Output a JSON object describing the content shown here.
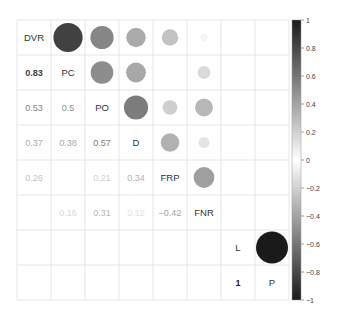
{
  "chart_data": {
    "type": "heatmap",
    "subtype": "correlation-matrix (mixed: numbers lower, circles upper)",
    "title": "",
    "variables": [
      "DVR",
      "PC",
      "PO",
      "D",
      "FRP",
      "FNR",
      "L",
      "P"
    ],
    "matrix": [
      [
        1.0,
        0.83,
        0.53,
        0.37,
        0.26,
        0.05,
        0.0,
        0.0
      ],
      [
        0.83,
        1.0,
        0.5,
        0.38,
        0.02,
        0.16,
        0.0,
        0.0
      ],
      [
        0.53,
        0.5,
        1.0,
        0.57,
        0.21,
        0.31,
        0.0,
        0.0
      ],
      [
        0.37,
        0.38,
        0.57,
        1.0,
        0.34,
        0.12,
        0.02,
        0.0
      ],
      [
        0.26,
        0.02,
        0.21,
        0.34,
        1.0,
        -0.42,
        0.0,
        0.0
      ],
      [
        0.05,
        0.16,
        0.31,
        0.12,
        -0.42,
        1.0,
        0.0,
        0.0
      ],
      [
        0.0,
        0.0,
        0.0,
        0.02,
        0.0,
        0.0,
        1.0,
        1.0
      ],
      [
        0.0,
        0.0,
        0.0,
        0.0,
        0.0,
        0.0,
        1.0,
        1.0
      ]
    ],
    "lower_labels": [
      {
        "row": 1,
        "col": 0,
        "text": "0.83"
      },
      {
        "row": 2,
        "col": 0,
        "text": "0.53"
      },
      {
        "row": 2,
        "col": 1,
        "text": "0.5"
      },
      {
        "row": 3,
        "col": 0,
        "text": "0.37"
      },
      {
        "row": 3,
        "col": 1,
        "text": "0.38"
      },
      {
        "row": 3,
        "col": 2,
        "text": "0.57"
      },
      {
        "row": 4,
        "col": 0,
        "text": "0.26"
      },
      {
        "row": 4,
        "col": 2,
        "text": "0.21"
      },
      {
        "row": 4,
        "col": 3,
        "text": "0.34"
      },
      {
        "row": 5,
        "col": 1,
        "text": "0.16"
      },
      {
        "row": 5,
        "col": 2,
        "text": "0.31"
      },
      {
        "row": 5,
        "col": 3,
        "text": "0.12"
      },
      {
        "row": 5,
        "col": 4,
        "text": "−0.42"
      },
      {
        "row": 7,
        "col": 6,
        "text": "1"
      }
    ],
    "colorbar": {
      "range": [
        -1,
        1
      ],
      "ticks": [
        "1",
        "0.8",
        "0.6",
        "0.4",
        "0.2",
        "0",
        "−0.2",
        "−0.4",
        "−0.6",
        "−0.8",
        "−1"
      ],
      "colormap": "grey: white at 0, black at ±1",
      "position": "right"
    },
    "grid": true,
    "legend_position": "right"
  }
}
